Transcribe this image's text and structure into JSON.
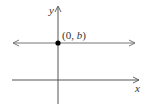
{
  "diagram": {
    "axes": {
      "x_label": "x",
      "y_label": "y"
    },
    "point": {
      "label_open": "(0, ",
      "label_var": "b",
      "label_close": ")"
    },
    "colors": {
      "axis": "#555555",
      "line": "#777777",
      "point": "#000000"
    }
  }
}
